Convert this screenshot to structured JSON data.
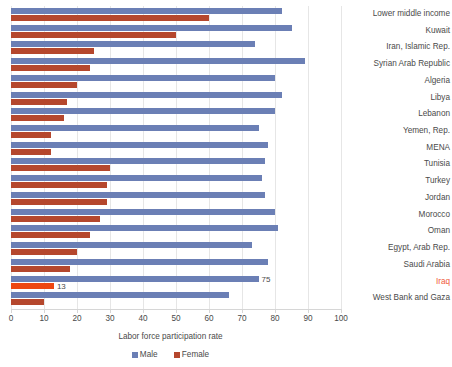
{
  "chart_data": {
    "type": "bar",
    "orientation": "horizontal",
    "title": "",
    "xlabel": "Labor force participation rate",
    "ylabel": "",
    "xlim": [
      0,
      100
    ],
    "xticks": [
      0,
      10,
      20,
      30,
      40,
      50,
      60,
      70,
      80,
      90,
      100
    ],
    "grid": true,
    "legend": [
      "Male",
      "Female"
    ],
    "legend_position": "bottom",
    "colors": {
      "male": "#6b7fb5",
      "female": "#b5472d",
      "male_highlight": "#6b7fb5",
      "female_highlight": "#ee4712",
      "highlight_label": "#ef5b3a",
      "gridline": "#e6e6e6",
      "axis": "#d6d6d6",
      "text": "#4a4a4a"
    },
    "highlight_category": "Iraq",
    "categories": [
      "Lower middle income",
      "Kuwait",
      "Iran, Islamic Rep.",
      "Syrian Arab Republic",
      "Algeria",
      "Libya",
      "Lebanon",
      "Yemen, Rep.",
      "MENA",
      "Tunisia",
      "Turkey",
      "Jordan",
      "Morocco",
      "Oman",
      "Egypt, Arab Rep.",
      "Saudi Arabia",
      "Iraq",
      "West Bank and Gaza"
    ],
    "series": [
      {
        "name": "Male",
        "values": [
          82,
          85,
          74,
          89,
          80,
          82,
          80,
          75,
          78,
          77,
          76,
          77,
          80,
          81,
          73,
          78,
          75,
          66
        ]
      },
      {
        "name": "Female",
        "values": [
          60,
          50,
          25,
          24,
          20,
          17,
          16,
          12,
          12,
          30,
          29,
          29,
          27,
          24,
          20,
          18,
          13,
          10
        ]
      }
    ],
    "data_labels": [
      {
        "category": "Iraq",
        "series": "Male",
        "text": "75"
      },
      {
        "category": "Iraq",
        "series": "Female",
        "text": "13"
      }
    ]
  }
}
